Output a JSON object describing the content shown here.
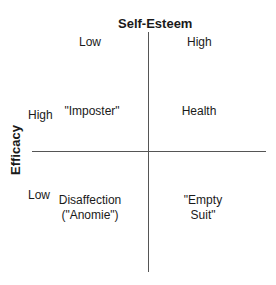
{
  "diagram": {
    "x_axis": {
      "title": "Self-Esteem",
      "low": "Low",
      "high": "High"
    },
    "y_axis": {
      "title": "Efficacy",
      "high": "High",
      "low": "Low"
    },
    "quadrants": {
      "top_left": {
        "line1": "\"Imposter\""
      },
      "top_right": {
        "line1": "Health"
      },
      "bottom_left": {
        "line1": "Disaffection",
        "line2": "(\"Anomie\")"
      },
      "bottom_right": {
        "line1": "\"Empty",
        "line2": "Suit\""
      }
    }
  }
}
